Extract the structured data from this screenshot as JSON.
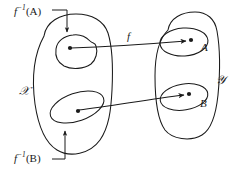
{
  "figure": {
    "kind": "set-mapping-diagram",
    "width": 245,
    "height": 174,
    "background_color": "#ffffff",
    "stroke_color": "#1a1a1a",
    "labels": {
      "preimage_a_prefix": "f",
      "preimage_a_exponent": "−1",
      "preimage_a_arg": "(A)",
      "preimage_b_prefix": "f",
      "preimage_b_exponent": "−1",
      "preimage_b_arg": "(B)",
      "domain_x": "𝒳",
      "codomain_y": "𝒴",
      "set_a": "A",
      "set_b": "B",
      "function_f": "f"
    },
    "elements": {
      "domain_outer_blob": "X",
      "codomain_outer_blob": "Y",
      "inner_blob_preimage_a": "f-inverse-of-A",
      "inner_blob_preimage_b": "f-inverse-of-B",
      "inner_blob_a": "A",
      "inner_blob_b": "B",
      "point_in_preimage_a": "x1",
      "point_in_preimage_b": "x2",
      "point_in_a": "y1",
      "point_in_b": "y2",
      "map_arrow_upper": "x1 -> y1",
      "map_arrow_lower": "x2 -> y2",
      "callout_arrow_a": "f-inverse-A callout",
      "callout_arrow_b": "f-inverse-B callout"
    }
  }
}
